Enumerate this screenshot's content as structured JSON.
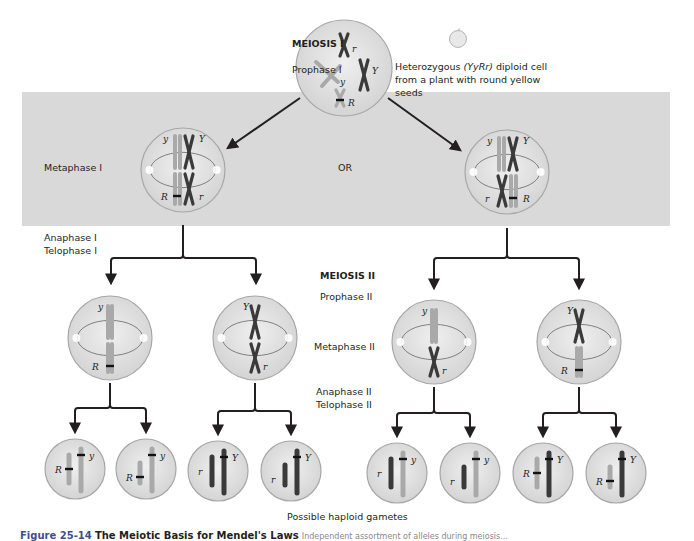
{
  "labels": {
    "meiosis_1": "MEIOSIS I",
    "prophase_1": "Prophase I",
    "cell_description_pre": "Heterozygous ",
    "cell_description_genotype": "(YyRr)",
    "cell_description_post": " diploid cell",
    "cell_description_line2": "from a plant with round yellow",
    "cell_description_line3": "seeds",
    "metaphase_1": "Metaphase I",
    "or": "OR",
    "anaphase_1": "Anaphase I",
    "telophase_1": "Telophase I",
    "meiosis_2": "MEIOSIS II",
    "prophase_2": "Prophase II",
    "metaphase_2": "Metaphase II",
    "anaphase_2": "Anaphase II",
    "telophase_2": "Telophase II",
    "gametes": "Possible haploid gametes"
  },
  "caption": {
    "figure_number": "Figure 25-14",
    "title": "The Meiotic Basis for Mendel's Laws",
    "rest": "Independent assortment of alleles during meiosis..."
  },
  "colors": {
    "band": "#d9d9d9",
    "cell_fill": "#e6e6e6",
    "cell_stroke": "#a7a7a7",
    "chrom_light": "#a9a9a9",
    "chrom_dark": "#3a3a3a",
    "arrow": "#231f20"
  },
  "cells": {
    "prophase_1": {
      "alleles": [
        "r",
        "y",
        "Y",
        "R"
      ]
    },
    "metaphase_1_left": {
      "alleles": [
        "y",
        "Y",
        "R",
        "r"
      ]
    },
    "metaphase_1_right": {
      "alleles": [
        "y",
        "Y",
        "r",
        "R"
      ]
    },
    "metaphase_2": [
      {
        "alleles": [
          "y",
          "R"
        ]
      },
      {
        "alleles": [
          "Y",
          "r"
        ]
      },
      {
        "alleles": [
          "y",
          "r"
        ]
      },
      {
        "alleles": [
          "Y",
          "R"
        ]
      }
    ],
    "gametes": [
      {
        "alleles": [
          "R",
          "y"
        ]
      },
      {
        "alleles": [
          "R",
          "y"
        ]
      },
      {
        "alleles": [
          "r",
          "Y"
        ]
      },
      {
        "alleles": [
          "r",
          "Y"
        ]
      },
      {
        "alleles": [
          "r",
          "y"
        ]
      },
      {
        "alleles": [
          "r",
          "y"
        ]
      },
      {
        "alleles": [
          "R",
          "Y"
        ]
      },
      {
        "alleles": [
          "R",
          "Y"
        ]
      }
    ]
  }
}
